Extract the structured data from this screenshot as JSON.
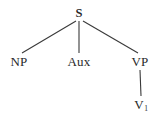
{
  "diagram": {
    "type": "syntax-tree",
    "background_color": "#ffffff",
    "line_color": "#3a3a3a",
    "text_color": "#2a2a2a",
    "nodes": [
      {
        "id": "s",
        "label": "S",
        "x": 79,
        "y": 13
      },
      {
        "id": "np",
        "label": "NP",
        "x": 19,
        "y": 61
      },
      {
        "id": "aux",
        "label": "Aux",
        "x": 79,
        "y": 61
      },
      {
        "id": "vp",
        "label": "VP",
        "x": 140,
        "y": 61
      },
      {
        "id": "v1",
        "label": "V",
        "subscript": "1",
        "x": 141,
        "y": 104
      }
    ],
    "edges": [
      {
        "from": "s",
        "to": "np",
        "x1": 76,
        "y1": 21,
        "x2": 22,
        "y2": 53
      },
      {
        "from": "s",
        "to": "aux",
        "x1": 79,
        "y1": 21,
        "x2": 79,
        "y2": 53
      },
      {
        "from": "s",
        "to": "vp",
        "x1": 83,
        "y1": 21,
        "x2": 138,
        "y2": 53
      },
      {
        "from": "vp",
        "to": "v1",
        "x1": 140,
        "y1": 70,
        "x2": 141,
        "y2": 96
      }
    ]
  }
}
